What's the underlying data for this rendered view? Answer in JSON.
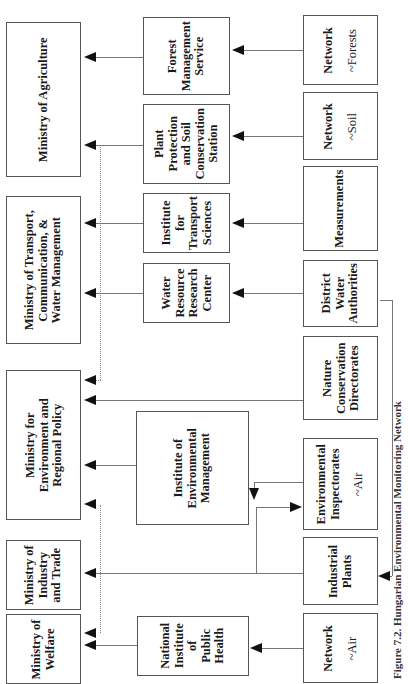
{
  "orientation": "rotated-90-ccw",
  "caption": "Figure 7.2. Hungarian Environmental Monitoring Network",
  "ministries": [
    {
      "id": "agriculture",
      "label": "Ministry of Agriculture"
    },
    {
      "id": "transport",
      "label": "Ministry of Transport,\nCommunication, &\nWater Management"
    },
    {
      "id": "environment",
      "label": "Ministry for\nEnvironment and\nRegional Policy"
    },
    {
      "id": "industry",
      "label": "Ministry of\nIndustry\nand Trade"
    },
    {
      "id": "welfare",
      "label": "Ministry of\nWelfare"
    }
  ],
  "institutions": [
    {
      "id": "forest",
      "label": "Forest\nManagement\nService"
    },
    {
      "id": "plant",
      "label": "Plant\nProtection\nand Soil\nConservation\nStation"
    },
    {
      "id": "transport_inst",
      "label": "Institute\nfor\nTransport\nSciences"
    },
    {
      "id": "water_center",
      "label": "Water\nResource\nResearch\nCenter"
    },
    {
      "id": "env_mgmt",
      "label": "Institute of\nEnvironmental\nManagement"
    },
    {
      "id": "public_health",
      "label": "National\nInstitute\nof\nPublic\nHealth"
    }
  ],
  "sources": [
    {
      "id": "net_forests",
      "label": "Network",
      "sub": "~Forests"
    },
    {
      "id": "net_soil",
      "label": "Network",
      "sub": "~Soil"
    },
    {
      "id": "measurements",
      "label": "Measurements"
    },
    {
      "id": "water_auth",
      "label": "District\nWater\nAuthorities"
    },
    {
      "id": "nature",
      "label": "Nature\nConservation\nDirectorates"
    },
    {
      "id": "env_insp",
      "label": "Environmental\nInspectorates",
      "sub": "~Air"
    },
    {
      "id": "ind_plants",
      "label": "Industrial\nPlants"
    },
    {
      "id": "net_air",
      "label": "Network",
      "sub": "~Air"
    }
  ]
}
